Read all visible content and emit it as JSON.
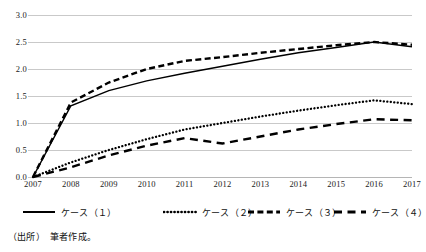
{
  "chart_data": {
    "type": "line",
    "title": "",
    "xlabel": "",
    "ylabel": "",
    "x": [
      2007,
      2008,
      2009,
      2010,
      2011,
      2012,
      2013,
      2014,
      2015,
      2016,
      2017
    ],
    "xtick_labels": [
      "2007",
      "2008",
      "2009",
      "2010",
      "2011",
      "2012",
      "2013",
      "2014",
      "2015",
      "2016",
      "2017"
    ],
    "ytick_labels": [
      "0.0",
      "0.5",
      "1.0",
      "1.5",
      "2.0",
      "2.5",
      "3.0"
    ],
    "ytick_values": [
      0.0,
      0.5,
      1.0,
      1.5,
      2.0,
      2.5,
      3.0
    ],
    "ylim": [
      0.0,
      3.0
    ],
    "grid": true,
    "legend_position": "below",
    "series": [
      {
        "name": "ケース（１）",
        "style": "solid",
        "values": [
          0.0,
          1.32,
          1.6,
          1.78,
          1.92,
          2.05,
          2.18,
          2.3,
          2.4,
          2.5,
          2.41
        ]
      },
      {
        "name": "ケース（２）",
        "style": "dotted",
        "values": [
          0.0,
          0.27,
          0.5,
          0.7,
          0.88,
          1.0,
          1.12,
          1.23,
          1.33,
          1.42,
          1.35
        ]
      },
      {
        "name": "ケース（３）",
        "style": "dashed",
        "values": [
          0.0,
          1.38,
          1.75,
          2.0,
          2.15,
          2.22,
          2.3,
          2.37,
          2.44,
          2.5,
          2.45
        ]
      },
      {
        "name": "ケース（４）",
        "style": "long-dash",
        "values": [
          0.0,
          0.18,
          0.4,
          0.58,
          0.72,
          0.62,
          0.75,
          0.88,
          0.98,
          1.07,
          1.05
        ]
      }
    ],
    "colors": {
      "series": "#000000",
      "grid": "#c9c9c9",
      "text": "#111111",
      "background": "#ffffff"
    }
  },
  "legend": {
    "items": [
      {
        "label": "ケース（１）",
        "style": "solid"
      },
      {
        "label": "ケース（２）",
        "style": "dotted"
      },
      {
        "label": "ケース（３）",
        "style": "dashed"
      },
      {
        "label": "ケース（４）",
        "style": "long-dash"
      }
    ]
  },
  "source": {
    "note": "（出所）　筆者作成。"
  }
}
